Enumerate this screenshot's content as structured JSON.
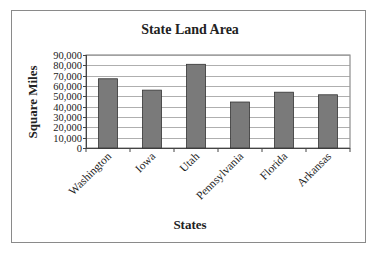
{
  "chart_data": {
    "type": "bar",
    "title": "State Land Area",
    "xlabel": "States",
    "ylabel": "Square Miles",
    "categories": [
      "Washington",
      "Iowa",
      "Utah",
      "Pennsylvania",
      "Florida",
      "Arkansas"
    ],
    "values": [
      67000,
      56000,
      81000,
      44500,
      54000,
      51500
    ],
    "ylim": [
      0,
      90000
    ],
    "yticks": [
      0,
      10000,
      20000,
      30000,
      40000,
      50000,
      60000,
      70000,
      80000,
      90000
    ],
    "ytick_labels": [
      "0",
      "10,000",
      "20,000",
      "30,000",
      "40,000",
      "50,000",
      "60,000",
      "70,000",
      "80,000",
      "90,000"
    ],
    "grid": true,
    "legend": null,
    "bar_color": "#7a7a7a",
    "bar_edge_color": "#333333"
  }
}
